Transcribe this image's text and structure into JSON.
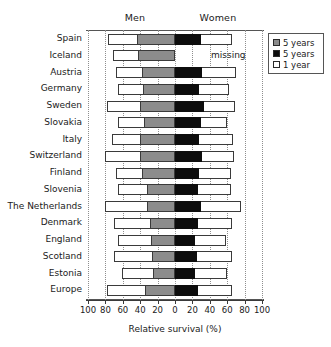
{
  "chart_data": {
    "type": "bar",
    "subtype": "diverging-stacked-horizontal",
    "title": "",
    "xlabel": "Relative survival (%)",
    "ylabel": "",
    "xlim": [
      -100,
      100
    ],
    "grid": true,
    "gridlines": [
      -100,
      -80,
      -60,
      -40,
      -20,
      0,
      20,
      40,
      60,
      80,
      100
    ],
    "tick_values": [
      -100,
      -80,
      -60,
      -40,
      -20,
      0,
      20,
      40,
      60,
      80,
      100
    ],
    "tick_labels": [
      "100",
      "80",
      "60",
      "40",
      "20",
      "0",
      "20",
      "40",
      "60",
      "80",
      "100"
    ],
    "panel_labels": [
      "Men",
      "Women"
    ],
    "legend_position": "top-right",
    "legend": [
      {
        "label": "5 years",
        "color": "#8c8c8c",
        "group": "Men"
      },
      {
        "label": "5 years",
        "color": "#0d0d0d",
        "group": "Women"
      },
      {
        "label": "1 year",
        "color": "#ffffff",
        "group": "Both"
      }
    ],
    "categories": [
      "Spain",
      "Iceland",
      "Austria",
      "Germany",
      "Sweden",
      "Slovakia",
      "Italy",
      "Switzerland",
      "Finland",
      "Slovenia",
      "The Netherlands",
      "Denmark",
      "England",
      "Scotland",
      "Estonia",
      "Europe"
    ],
    "series": [
      {
        "name": "Men 1 year",
        "values": [
          77,
          71,
          68,
          66,
          78,
          66,
          72,
          81,
          68,
          66,
          80,
          70,
          65,
          70,
          61,
          78
        ]
      },
      {
        "name": "Men 5 years",
        "values": [
          44,
          42,
          38,
          37,
          40,
          36,
          40,
          40,
          38,
          32,
          32,
          29,
          28,
          26,
          25,
          34
        ]
      },
      {
        "name": "Women 5 years",
        "values": [
          30,
          null,
          31,
          28,
          33,
          30,
          28,
          31,
          28,
          26,
          30,
          26,
          23,
          25,
          23,
          27
        ]
      },
      {
        "name": "Women 1 year",
        "values": [
          65,
          null,
          70,
          62,
          69,
          60,
          67,
          68,
          64,
          64,
          76,
          65,
          59,
          65,
          60,
          65
        ]
      }
    ],
    "annotations": [
      {
        "category": "Iceland",
        "side": "Women",
        "text": "missing"
      }
    ]
  },
  "legend": {
    "items": [
      {
        "label": "5 years"
      },
      {
        "label": "5 years"
      },
      {
        "label": "1 year"
      }
    ]
  },
  "axis": {
    "title": "Relative survival (%)"
  },
  "headers": {
    "men": "Men",
    "women": "Women"
  }
}
